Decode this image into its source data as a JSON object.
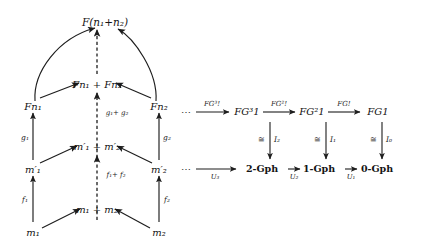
{
  "figure": {
    "kind": "commutative-diagram-pair",
    "background": "#ffffff",
    "ink": "#141414"
  },
  "left_diagram": {
    "name": "coproduct-preservation-prism",
    "nodes": {
      "top": "F(n₁+n₂)",
      "mid_sum": "Fn₁ + Fn₂",
      "mid_left": "Fn₁",
      "mid_right": "Fn₂",
      "low_sum_primed": "m′₁ + m′₂",
      "low_left_primed": "m′₁",
      "low_right_primed": "m′₂",
      "bottom_sum": "m₁ + m₂",
      "bottom_left": "m₁",
      "bottom_right": "m₂"
    },
    "arrow_labels": {
      "g1": "g₁",
      "g2": "g₂",
      "f1": "f₁",
      "f2": "f₂",
      "g1_plus_g2": "g₁+ g₂",
      "f1_plus_f2": "f₁+ f₂"
    }
  },
  "right_diagram": {
    "name": "free-forgetful-tower",
    "top_row": {
      "leading_ellipsis": "⋯",
      "objects": [
        "FG³1",
        "FG²1",
        "FG1"
      ],
      "arrows": [
        "FG³!",
        "FG²!",
        "FG!"
      ]
    },
    "bottom_row": {
      "leading_ellipsis": "⋯",
      "objects": [
        "2-Gph",
        "1-Gph",
        "0-Gph"
      ],
      "arrows": [
        "U₃",
        "U₂",
        "U₁"
      ]
    },
    "vertical_arrows": [
      {
        "iso": "≅",
        "label": "I₂"
      },
      {
        "iso": "≅",
        "label": "I₁"
      },
      {
        "iso": "≅",
        "label": "I₀"
      }
    ]
  }
}
